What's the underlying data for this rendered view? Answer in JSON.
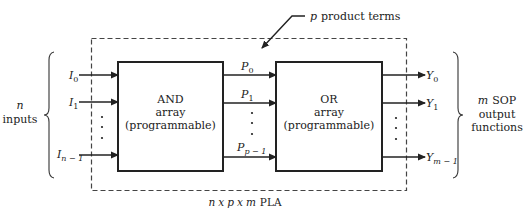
{
  "diagram": {
    "title_parts": {
      "n": "n",
      "x1": "x",
      "p": "p",
      "x2": "x",
      "m": "m",
      "suffix": "PLA"
    },
    "product_terms_label": {
      "var": "p",
      "text": "product terms"
    },
    "left_brace_label": {
      "var": "n",
      "text": "inputs"
    },
    "right_brace_label": {
      "var": "m",
      "line1": "SOP",
      "line2": "output",
      "line3": "functions"
    },
    "and_array": {
      "line1": "AND",
      "line2": "array",
      "line3": "(programmable)"
    },
    "or_array": {
      "line1": "OR",
      "line2": "array",
      "line3": "(programmable)"
    },
    "inputs": [
      {
        "base": "I",
        "sub": "0"
      },
      {
        "base": "I",
        "sub": "1"
      },
      {
        "base": "I",
        "sub": "n − 1"
      }
    ],
    "product_terms": [
      {
        "base": "P",
        "sub": "0"
      },
      {
        "base": "P",
        "sub": "1"
      },
      {
        "base": "P",
        "sub": "p − 1"
      }
    ],
    "outputs": [
      {
        "base": "Y",
        "sub": "0"
      },
      {
        "base": "Y",
        "sub": "1"
      },
      {
        "base": "Y",
        "sub": "m − 1"
      }
    ],
    "ellipsis": "⋮",
    "colors": {
      "line": "#222222",
      "dashed": "#444444",
      "background": "#ffffff"
    }
  }
}
